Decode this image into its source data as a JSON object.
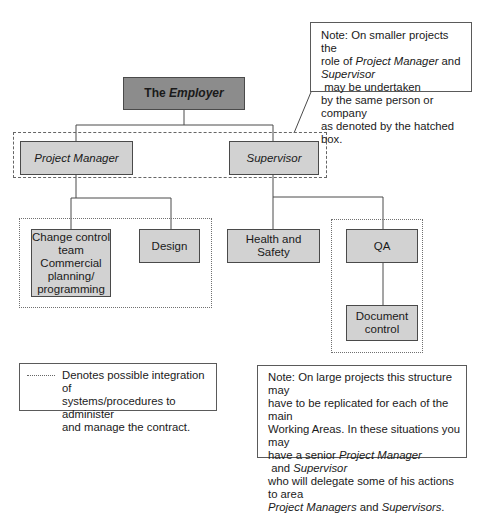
{
  "diagram": {
    "root": {
      "prefix": "The ",
      "emph": "Employer"
    },
    "level2": [
      {
        "label": "Project Manager"
      },
      {
        "label": "Supervisor"
      }
    ],
    "level3": [
      {
        "label": "Change control team Commercial planning/ programming",
        "lines": [
          "Change control",
          "team",
          "Commercial",
          "planning/",
          "programming"
        ]
      },
      {
        "label": "Design"
      },
      {
        "label": "Health and Safety"
      },
      {
        "label": "QA"
      }
    ],
    "level4": [
      {
        "label": "Document control",
        "lines": [
          "Document",
          "control"
        ]
      }
    ],
    "note_top": {
      "lines": [
        [
          "Note: On smaller projects the"
        ],
        [
          "role of ",
          "Project Manager",
          " and"
        ],
        [
          "Supervisor",
          " may be undertaken"
        ],
        [
          "by the same person or company"
        ],
        [
          "as denoted by the hatched box."
        ]
      ]
    },
    "legend": {
      "symbol": "dotted-line",
      "text_lines": [
        "Denotes possible integration of",
        "systems/procedures to administer",
        "and manage the contract."
      ]
    },
    "note_bottom": {
      "lines": [
        [
          "Note: On large projects this structure may"
        ],
        [
          "have to be replicated for each of the main"
        ],
        [
          "Working Areas. In these situations you may"
        ],
        [
          "have a senior ",
          "Project Manager",
          " and ",
          "Supervisor"
        ],
        [
          "who will delegate some of his actions to area"
        ],
        [
          "Project Managers",
          " and ",
          "Supervisors",
          "."
        ]
      ]
    },
    "colors": {
      "root_fill": "#8c8c8c",
      "node_fill": "#d2d2d2",
      "line": "#4a4a4a"
    }
  }
}
